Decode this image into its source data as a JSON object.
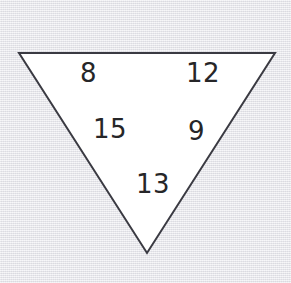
{
  "figure": {
    "type": "inverted-triangle-with-numbers",
    "canvas": {
      "width": 291,
      "height": 283
    },
    "background_color": "#ebebee",
    "shape": {
      "name": "triangle",
      "orientation": "point-down",
      "fill_color": "#ffffff",
      "stroke_color": "#3a3a42",
      "stroke_width": 2,
      "vertices": [
        {
          "label": "top-left",
          "x": 19,
          "y": 53
        },
        {
          "label": "top-right",
          "x": 275,
          "y": 53
        },
        {
          "label": "bottom",
          "x": 147,
          "y": 253
        }
      ]
    },
    "text_color": "#262628",
    "numbers": [
      {
        "id": "number-8",
        "value": "8",
        "x": 80,
        "y": 60
      },
      {
        "id": "number-12",
        "value": "12",
        "x": 186,
        "y": 60
      },
      {
        "id": "number-15",
        "value": "15",
        "x": 93,
        "y": 116
      },
      {
        "id": "number-9",
        "value": "9",
        "x": 188,
        "y": 118
      },
      {
        "id": "number-13",
        "value": "13",
        "x": 136,
        "y": 171
      }
    ]
  }
}
